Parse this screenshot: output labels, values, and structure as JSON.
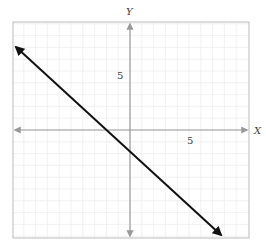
{
  "chart_data": {
    "type": "line",
    "title": "",
    "xlabel": "X",
    "ylabel": "Y",
    "xlim": [
      -10,
      10
    ],
    "ylim": [
      -9,
      9
    ],
    "x_tick_labels": [
      {
        "value": 5,
        "label": "5"
      }
    ],
    "y_tick_labels": [
      {
        "value": 5,
        "label": "5"
      }
    ],
    "grid": true,
    "series": [
      {
        "name": "line",
        "equation": "y = -x - 2",
        "slope": -1,
        "intercept": -2,
        "x": [
          -9.7,
          7.8
        ],
        "y": [
          7.7,
          -9.8
        ],
        "arrows": "both",
        "color": "#111111"
      }
    ]
  },
  "colors": {
    "axis": "#999999",
    "frame": "#bbbbbb",
    "grid": "#eeeeee",
    "line": "#111111"
  }
}
